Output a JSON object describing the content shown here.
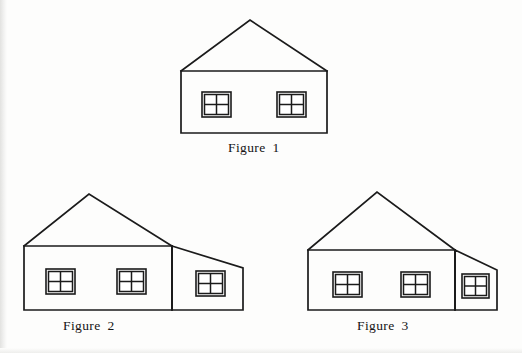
{
  "page": {
    "background_color": "#fdfdfc",
    "ink_color": "#1b1b1b",
    "width": 522,
    "height": 353
  },
  "figures": [
    {
      "id": "figure-1",
      "caption": "Figure  1",
      "caption_text": "Figure 1",
      "number": "1",
      "window_count": 2,
      "has_extension": false,
      "geometry": {
        "apex": [
          250,
          20
        ],
        "eave_left": [
          181,
          71
        ],
        "eave_right": [
          327,
          71
        ],
        "base_left": [
          181,
          133
        ],
        "base_right": [
          327,
          133
        ],
        "body_points": "181,71 327,71 327,133 181,133",
        "roof_points": "181,71 250,20 327,71"
      },
      "windows": [
        {
          "name": "window-left",
          "x": 202,
          "y": 92,
          "w": 29,
          "h": 25,
          "panes": "2x2"
        },
        {
          "name": "window-right",
          "x": 277,
          "y": 92,
          "w": 29,
          "h": 25,
          "panes": "2x2"
        }
      ]
    },
    {
      "id": "figure-2",
      "caption": "Figure  2",
      "caption_text": "Figure 2",
      "number": "2",
      "window_count": 3,
      "has_extension": true,
      "extension_side": "right",
      "geometry": {
        "apex": [
          89,
          194
        ],
        "eave_left": [
          24,
          246
        ],
        "ridge_junction": [
          172,
          246
        ],
        "ext_roof_end": [
          243,
          268
        ],
        "base_left": [
          24,
          310
        ],
        "base_right": [
          243,
          310
        ],
        "main_points": "24,246 172,246 172,310 24,310",
        "roof_points": "24,246 89,194 172,246",
        "extension_points": "172,246 243,268 243,310 172,310",
        "divider_line": [
          172,
          246,
          172,
          310
        ]
      },
      "windows": [
        {
          "name": "window-1",
          "x": 46,
          "y": 269,
          "w": 29,
          "h": 25,
          "panes": "2x2"
        },
        {
          "name": "window-2",
          "x": 117,
          "y": 269,
          "w": 29,
          "h": 25,
          "panes": "2x2"
        },
        {
          "name": "window-3",
          "x": 196,
          "y": 271,
          "w": 29,
          "h": 25,
          "panes": "2x2"
        }
      ]
    },
    {
      "id": "figure-3",
      "caption": "Figure  3",
      "caption_text": "Figure 3",
      "number": "3",
      "window_count": 3,
      "has_extension": true,
      "extension_side": "right",
      "geometry": {
        "apex": [
          377,
          192
        ],
        "eave_left": [
          308,
          250
        ],
        "ridge_junction": [
          455,
          250
        ],
        "ext_roof_end": [
          497,
          270
        ],
        "base_left": [
          308,
          310
        ],
        "base_right": [
          497,
          310
        ],
        "main_points": "308,250 455,250 455,310 308,310",
        "roof_points": "308,250 377,192 455,250",
        "extension_points": "455,250 497,270 497,310 455,310",
        "divider_line": [
          455,
          250,
          455,
          310
        ]
      },
      "windows": [
        {
          "name": "window-1",
          "x": 333,
          "y": 272,
          "w": 29,
          "h": 25,
          "panes": "2x2"
        },
        {
          "name": "window-2",
          "x": 401,
          "y": 272,
          "w": 29,
          "h": 25,
          "panes": "2x2"
        },
        {
          "name": "window-3",
          "x": 462,
          "y": 274,
          "w": 27,
          "h": 24,
          "panes": "2x2"
        }
      ]
    }
  ]
}
